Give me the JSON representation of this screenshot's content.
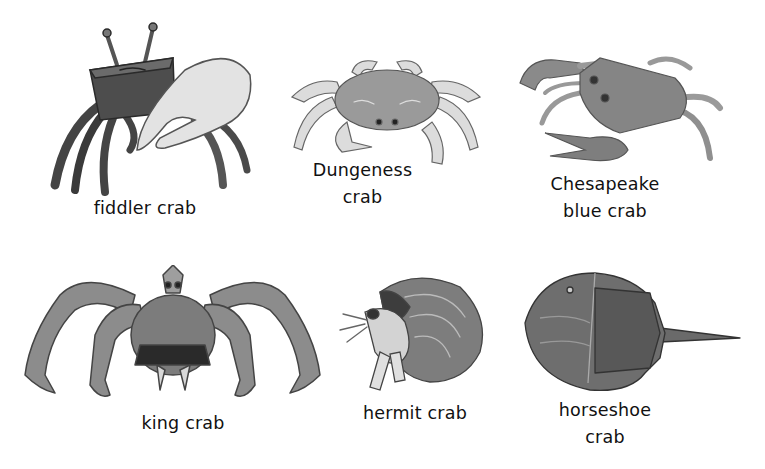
{
  "figure": {
    "background": "#ffffff",
    "ink_color": "#111111",
    "items": [
      {
        "id": "fiddler",
        "lines": [
          "fiddler crab"
        ],
        "illustration": "fiddler-crab-illustration"
      },
      {
        "id": "dungeness",
        "lines": [
          "Dungeness",
          "crab"
        ],
        "illustration": "dungeness-crab-illustration"
      },
      {
        "id": "chesapeake",
        "lines": [
          "Chesapeake",
          "blue crab"
        ],
        "illustration": "blue-crab-illustration"
      },
      {
        "id": "king",
        "lines": [
          "king crab"
        ],
        "illustration": "king-crab-illustration"
      },
      {
        "id": "hermit",
        "lines": [
          "hermit crab"
        ],
        "illustration": "hermit-crab-illustration"
      },
      {
        "id": "horseshoe",
        "lines": [
          "horseshoe",
          "crab"
        ],
        "illustration": "horseshoe-crab-illustration"
      }
    ]
  }
}
